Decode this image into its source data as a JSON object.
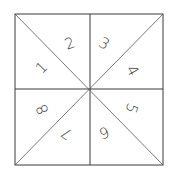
{
  "diagram": {
    "sections": [
      {
        "label": "1",
        "x": 42,
        "y": 68,
        "rotate": -45
      },
      {
        "label": "2",
        "x": 70,
        "y": 44,
        "rotate": -20
      },
      {
        "label": "3",
        "x": 104,
        "y": 44,
        "rotate": 30
      },
      {
        "label": "4",
        "x": 132,
        "y": 71,
        "rotate": 60
      },
      {
        "label": "5",
        "x": 131,
        "y": 108,
        "rotate": 110
      },
      {
        "label": "6",
        "x": 104,
        "y": 132,
        "rotate": 160
      },
      {
        "label": "7",
        "x": 67,
        "y": 133,
        "rotate": 215
      },
      {
        "label": "8",
        "x": 43,
        "y": 109,
        "rotate": 245
      }
    ],
    "colors": {
      "line": "#3a3a3a",
      "background": "#ffffff"
    }
  }
}
